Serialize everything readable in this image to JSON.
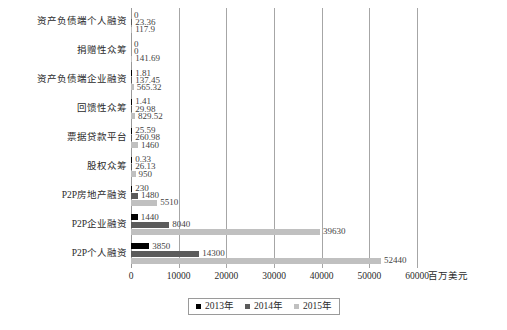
{
  "chart_data": {
    "type": "bar",
    "orientation": "horizontal",
    "title": "",
    "xlabel": "百万美元",
    "ylabel": "",
    "xlim": [
      0,
      60000
    ],
    "xticks": [
      0,
      10000,
      20000,
      30000,
      40000,
      50000,
      60000
    ],
    "xtick_labels": [
      "0",
      "10000",
      "20000",
      "30000",
      "40000",
      "50000",
      "60000"
    ],
    "grid": true,
    "legend_position": "bottom",
    "categories": [
      "资产负债端个人融资",
      "捐赠性众筹",
      "资产负债端企业融资",
      "回馈性众筹",
      "票据贷款平台",
      "股权众筹",
      "P2P房地产融资",
      "P2P企业融资",
      "P2P个人融资"
    ],
    "series": [
      {
        "name": "2013年",
        "color": "#000000",
        "values": [
          0,
          0,
          1.81,
          1.41,
          25.59,
          0.33,
          230,
          1440,
          3850
        ],
        "labels": [
          "0",
          "0",
          "1.81",
          "1.41",
          "25.59",
          "0.33",
          "230",
          "1440",
          "3850"
        ]
      },
      {
        "name": "2014年",
        "color": "#5b5b5b",
        "values": [
          23.36,
          0,
          137.45,
          29.98,
          260.98,
          26.13,
          1480,
          8040,
          14300
        ],
        "labels": [
          "23.36",
          "0",
          "137.45",
          "29.98",
          "260.98",
          "26.13",
          "1480",
          "8040",
          "14300"
        ]
      },
      {
        "name": "2015年",
        "color": "#c0c0c0",
        "values": [
          117.9,
          141.69,
          565.32,
          829.52,
          1460,
          950,
          5510,
          39630,
          52440
        ],
        "labels": [
          "117.9",
          "141.69",
          "565.32",
          "829.52",
          "1460",
          "950",
          "5510",
          "39630",
          "52440"
        ]
      }
    ]
  },
  "legend": {
    "items": [
      {
        "label": "2013年",
        "color": "#000000"
      },
      {
        "label": "2014年",
        "color": "#5b5b5b"
      },
      {
        "label": "2015年",
        "color": "#c0c0c0"
      }
    ]
  },
  "axis": {
    "unit_label": "百万美元"
  }
}
